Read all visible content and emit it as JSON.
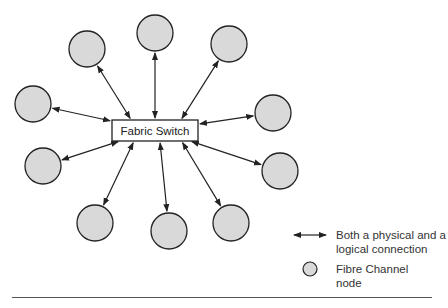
{
  "diagram": {
    "switch": {
      "label": "Fabric Switch",
      "x": 112,
      "y": 120,
      "w": 86,
      "h": 21
    },
    "nodes": [
      {
        "id": "n1",
        "cx": 87,
        "cy": 49
      },
      {
        "id": "n2",
        "cx": 155,
        "cy": 33
      },
      {
        "id": "n3",
        "cx": 229,
        "cy": 44
      },
      {
        "id": "n4",
        "cx": 33,
        "cy": 104
      },
      {
        "id": "n5",
        "cx": 273,
        "cy": 113
      },
      {
        "id": "n6",
        "cx": 43,
        "cy": 166
      },
      {
        "id": "n7",
        "cx": 280,
        "cy": 171
      },
      {
        "id": "n8",
        "cx": 95,
        "cy": 223
      },
      {
        "id": "n9",
        "cx": 169,
        "cy": 231
      },
      {
        "id": "n10",
        "cx": 231,
        "cy": 223
      }
    ],
    "node_radius": 18,
    "node_fill": "#d9d9d9",
    "stroke": "#222222"
  },
  "legend": {
    "arrow_label_line1": "Both a physical and a",
    "arrow_label_line2": "logical connection",
    "node_label_line1": "Fibre Channel",
    "node_label_line2": "node"
  }
}
